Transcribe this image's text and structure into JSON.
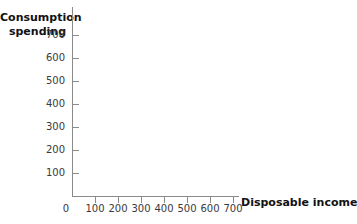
{
  "chart_data": {
    "type": "scatter",
    "title": "",
    "subtitle": "",
    "xlabel": "Disposable income",
    "ylabel": "Consumption spending",
    "ylabel_line1": "Consumption",
    "ylabel_line2": "spending",
    "origin_label": "0",
    "x_ticks": [
      100,
      200,
      300,
      400,
      500,
      600,
      700
    ],
    "x_tick_labels": [
      "100",
      "200",
      "300",
      "400",
      "500",
      "600",
      "700"
    ],
    "y_ticks": [
      100,
      200,
      300,
      400,
      500,
      600,
      700
    ],
    "y_tick_labels": [
      "100",
      "200",
      "300",
      "400",
      "500",
      "600",
      "700"
    ],
    "xlim": [
      0,
      740
    ],
    "ylim": [
      0,
      770
    ],
    "grid": false,
    "legend": false,
    "series": [
      {
        "name": "",
        "x": [],
        "y": []
      }
    ],
    "annotations": [],
    "note": "Empty axes template: no data plotted"
  },
  "colors": {
    "background": "#ffffff",
    "axis": "#8a8a8a",
    "tick_label_text": "#3a3a3a",
    "axis_title_text": "#111111"
  }
}
